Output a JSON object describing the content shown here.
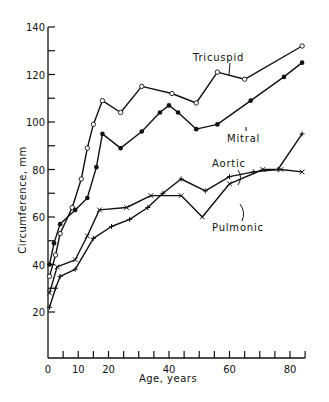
{
  "chart_data": {
    "type": "line",
    "title": "",
    "xlabel": "Age, years",
    "ylabel": "Circumference, mm",
    "xlim": [
      0,
      85
    ],
    "ylim": [
      10,
      140
    ],
    "x_ticks": [
      0,
      10,
      20,
      30,
      40,
      50,
      60,
      70,
      80
    ],
    "x_tick_labels": [
      "0",
      "10",
      "20",
      "40",
      "60",
      "80"
    ],
    "x_labeled_ticks": [
      0,
      10,
      20,
      40,
      60,
      80
    ],
    "y_ticks": [
      20,
      30,
      40,
      50,
      60,
      70,
      80,
      90,
      100,
      110,
      120,
      130,
      140
    ],
    "y_tick_labels": [
      "20",
      "40",
      "60",
      "80",
      "100",
      "120",
      "140"
    ],
    "grid": false,
    "legend": "inline labels",
    "series": [
      {
        "name": "Tricuspid",
        "marker": "open-circle",
        "label_pos": [
          48,
          137
        ],
        "points": [
          [
            0.5,
            35
          ],
          [
            2.5,
            44
          ],
          [
            4,
            53
          ],
          [
            8,
            64
          ],
          [
            11,
            76
          ],
          [
            13,
            89
          ],
          [
            15,
            99
          ],
          [
            18,
            109
          ],
          [
            24,
            104
          ],
          [
            31,
            115
          ],
          [
            41,
            112
          ],
          [
            49,
            108
          ],
          [
            56,
            121
          ],
          [
            65,
            118
          ],
          [
            84,
            132
          ]
        ]
      },
      {
        "name": "Mitral",
        "marker": "filled-circle",
        "label_pos": [
          57,
          96
        ],
        "points": [
          [
            0.5,
            40
          ],
          [
            2,
            49
          ],
          [
            4,
            57
          ],
          [
            9,
            63
          ],
          [
            13,
            68
          ],
          [
            16,
            81
          ],
          [
            18,
            95
          ],
          [
            24,
            89
          ],
          [
            31,
            96
          ],
          [
            37,
            104
          ],
          [
            40,
            107
          ],
          [
            43,
            104
          ],
          [
            49,
            97
          ],
          [
            56,
            99
          ],
          [
            67,
            109
          ],
          [
            78,
            119
          ],
          [
            84,
            125
          ]
        ]
      },
      {
        "name": "Aortic",
        "marker": "plus",
        "label_pos": [
          59,
          77
        ],
        "points": [
          [
            0.5,
            22
          ],
          [
            2.5,
            30
          ],
          [
            4,
            35
          ],
          [
            9,
            38
          ],
          [
            15,
            51
          ],
          [
            21,
            56
          ],
          [
            27,
            59
          ],
          [
            33,
            64
          ],
          [
            38,
            70
          ],
          [
            44,
            76
          ],
          [
            52,
            71
          ],
          [
            60,
            77
          ],
          [
            68,
            79
          ],
          [
            76,
            80
          ],
          [
            84,
            95
          ]
        ]
      },
      {
        "name": "Pulmonic",
        "marker": "cross",
        "label_pos": [
          55,
          58
        ],
        "points": [
          [
            0.5,
            28
          ],
          [
            3,
            39
          ],
          [
            9,
            42
          ],
          [
            13,
            52
          ],
          [
            17,
            63
          ],
          [
            26,
            64
          ],
          [
            34,
            69
          ],
          [
            44,
            69
          ],
          [
            51,
            60
          ],
          [
            60,
            74
          ],
          [
            71,
            80
          ],
          [
            77,
            80
          ],
          [
            84,
            79
          ]
        ]
      }
    ]
  },
  "labels": {
    "xlabel": "Age, years",
    "ylabel": "Circumference, mm",
    "tricuspid": "Tricuspid",
    "mitral": "Mitral",
    "aortic": "Aortic",
    "pulmonic": "Pulmonic"
  }
}
